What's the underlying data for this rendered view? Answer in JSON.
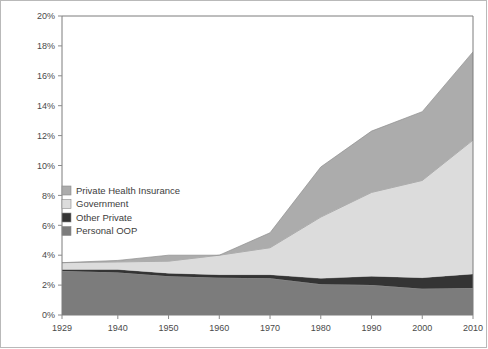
{
  "chart_data": {
    "type": "area",
    "stacked": true,
    "title": "",
    "subtitle": "",
    "xlabel": "",
    "ylabel": "",
    "grid": false,
    "legend_position": "inside-left",
    "x": [
      1929,
      1940,
      1950,
      1960,
      1970,
      1980,
      1990,
      2000,
      2010
    ],
    "categories": [
      "1929",
      "1940",
      "1950",
      "1960",
      "1970",
      "1980",
      "1990",
      "2000",
      "2010"
    ],
    "xlim": [
      1929,
      2010
    ],
    "ylim": [
      0,
      20
    ],
    "xticks": [
      "1929",
      "1940",
      "1950",
      "1960",
      "1970",
      "1980",
      "1990",
      "2000",
      "2010"
    ],
    "yticks": [
      "0%",
      "2%",
      "4%",
      "6%",
      "8%",
      "10%",
      "12%",
      "14%",
      "16%",
      "18%",
      "20%"
    ],
    "ytick_values": [
      0,
      2,
      4,
      6,
      8,
      10,
      12,
      14,
      16,
      18,
      20
    ],
    "value_suffix": "%",
    "series": [
      {
        "name": "Personal OOP",
        "color": "#7c7c7c",
        "values": [
          2.95,
          2.85,
          2.6,
          2.5,
          2.45,
          2.05,
          2.0,
          1.75,
          1.8
        ]
      },
      {
        "name": "Other Private",
        "color": "#343434",
        "values": [
          0.1,
          0.2,
          0.2,
          0.2,
          0.25,
          0.4,
          0.6,
          0.75,
          0.95
        ]
      },
      {
        "name": "Government",
        "color": "#dcdcdc",
        "values": [
          0.45,
          0.5,
          0.8,
          1.3,
          1.8,
          4.1,
          5.6,
          6.5,
          8.95
        ]
      },
      {
        "name": "Private Health Insurance",
        "color": "#acacac",
        "values": [
          0.0,
          0.1,
          0.4,
          0.0,
          1.0,
          3.35,
          4.1,
          4.6,
          5.9
        ]
      }
    ],
    "stack_order_bottom_to_top": [
      "Personal OOP",
      "Other Private",
      "Government",
      "Private Health Insurance"
    ],
    "legend_entries": [
      {
        "label": "Private Health Insurance",
        "color": "#acacac"
      },
      {
        "label": "Government",
        "color": "#dcdcdc"
      },
      {
        "label": "Other Private",
        "color": "#343434"
      },
      {
        "label": "Personal OOP",
        "color": "#7c7c7c"
      }
    ],
    "totals": [
      3.5,
      3.65,
      4.0,
      4.0,
      5.5,
      9.9,
      12.3,
      13.6,
      17.6
    ]
  },
  "figure": {
    "background_color": "#ffffff",
    "border_color": "#b9b9b9",
    "axis_color": "#7d7d7d",
    "text_color": "#4a4a4a"
  }
}
